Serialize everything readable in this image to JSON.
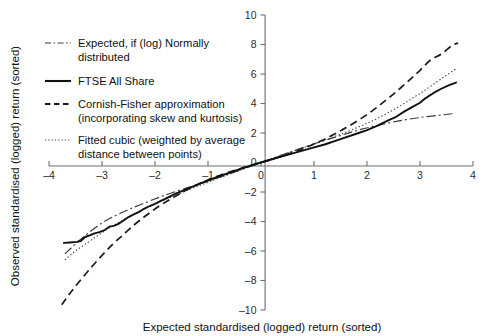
{
  "chart_data": {
    "type": "line",
    "title": "",
    "xlabel": "Expected standardised (logged) return (sorted)",
    "ylabel": "Observed standardised (logged) return (sorted)",
    "xlim": [
      -4,
      4
    ],
    "ylim": [
      -10,
      10
    ],
    "xticks": [
      -4,
      -3,
      -2,
      -1,
      0,
      1,
      2,
      3,
      4
    ],
    "xtick_labels": [
      "–4",
      "–3",
      "–2",
      "–1",
      "0",
      "1",
      "2",
      "3",
      "4"
    ],
    "yticks": [
      -10,
      -8,
      -6,
      -4,
      -2,
      0,
      2,
      4,
      6,
      8,
      10
    ],
    "ytick_labels": [
      "–10",
      "–8",
      "–6",
      "–4",
      "–2",
      "0",
      "2",
      "4",
      "6",
      "8",
      "10"
    ],
    "grid": false,
    "legend_position": "upper-left",
    "axes_style": "spines-bottom-and-center-vertical",
    "series": [
      {
        "name": "Expected, if (log) Normally distributed",
        "style": "dash-dot",
        "color": "#3a3a3a",
        "x": [
          -3.7,
          -3.4,
          -3.0,
          -2.6,
          -2.2,
          -1.8,
          -1.4,
          -1.0,
          -0.6,
          -0.2,
          0.0,
          0.2,
          0.6,
          1.0,
          1.4,
          1.8,
          2.2,
          2.6,
          3.0,
          3.4,
          3.65
        ],
        "y": [
          -6.2,
          -5.2,
          -4.1,
          -3.35,
          -2.75,
          -2.2,
          -1.72,
          -1.26,
          -0.78,
          -0.26,
          0.0,
          0.26,
          0.78,
          1.26,
          1.72,
          2.16,
          2.52,
          2.82,
          3.05,
          3.22,
          3.32
        ]
      },
      {
        "name": "FTSE All Share",
        "style": "solid",
        "color": "#111111",
        "x": [
          -3.72,
          -3.6,
          -3.48,
          -3.4,
          -3.32,
          -3.22,
          -3.14,
          -3.05,
          -2.95,
          -2.86,
          -2.78,
          -2.7,
          -2.6,
          -2.5,
          -2.4,
          -2.3,
          -2.2,
          -2.1,
          -2.0,
          -1.9,
          -1.8,
          -1.6,
          -1.4,
          -1.2,
          -1.0,
          -0.8,
          -0.6,
          -0.4,
          -0.2,
          -0.05,
          0.0,
          0.1,
          0.3,
          0.6,
          0.9,
          1.2,
          1.5,
          1.8,
          2.0,
          2.2,
          2.4,
          2.55,
          2.7,
          2.85,
          3.0,
          3.1,
          3.25,
          3.4,
          3.55,
          3.68
        ],
        "y": [
          -5.45,
          -5.42,
          -5.38,
          -5.32,
          -5.05,
          -4.92,
          -4.8,
          -4.72,
          -4.58,
          -4.35,
          -4.3,
          -4.18,
          -3.95,
          -3.7,
          -3.52,
          -3.35,
          -3.12,
          -2.95,
          -2.8,
          -2.62,
          -2.45,
          -2.1,
          -1.8,
          -1.5,
          -1.22,
          -0.95,
          -0.7,
          -0.45,
          -0.22,
          -0.05,
          0.0,
          0.1,
          0.32,
          0.62,
          0.92,
          1.22,
          1.58,
          1.95,
          2.2,
          2.5,
          2.85,
          3.1,
          3.45,
          3.75,
          4.05,
          4.35,
          4.7,
          5.0,
          5.25,
          5.42
        ]
      },
      {
        "name": "Cornish-Fisher approximation (incorporating skew and kurtosis)",
        "style": "dashed",
        "color": "#1c1c1c",
        "x": [
          -3.76,
          -3.6,
          -3.4,
          -3.2,
          -3.0,
          -2.8,
          -2.6,
          -2.4,
          -2.2,
          -2.0,
          -1.8,
          -1.6,
          -1.4,
          -1.2,
          -1.0,
          -0.8,
          -0.6,
          -0.4,
          -0.2,
          0.0,
          0.2,
          0.4,
          0.6,
          0.8,
          1.0,
          1.2,
          1.4,
          1.6,
          1.8,
          2.0,
          2.2,
          2.4,
          2.6,
          2.8,
          3.0,
          3.2,
          3.4,
          3.6,
          3.72
        ],
        "y": [
          -9.65,
          -8.85,
          -7.95,
          -7.1,
          -6.3,
          -5.55,
          -4.9,
          -4.25,
          -3.68,
          -3.15,
          -2.68,
          -2.25,
          -1.85,
          -1.5,
          -1.18,
          -0.9,
          -0.65,
          -0.42,
          -0.2,
          0.0,
          0.21,
          0.44,
          0.68,
          0.95,
          1.25,
          1.58,
          1.95,
          2.35,
          2.78,
          3.25,
          3.78,
          4.35,
          4.95,
          5.58,
          6.25,
          6.95,
          7.35,
          7.92,
          8.1
        ]
      },
      {
        "name": "Fitted cubic (weighted by average distance between points)",
        "style": "dotted",
        "color": "#4a4a4a",
        "x": [
          -3.7,
          -3.5,
          -3.3,
          -3.1,
          -2.9,
          -2.7,
          -2.5,
          -2.3,
          -2.1,
          -1.9,
          -1.7,
          -1.5,
          -1.3,
          -1.1,
          -0.9,
          -0.7,
          -0.5,
          -0.3,
          -0.1,
          0.0,
          0.2,
          0.4,
          0.7,
          1.0,
          1.3,
          1.6,
          1.9,
          2.1,
          2.3,
          2.5,
          2.7,
          2.9,
          3.1,
          3.3,
          3.5,
          3.68
        ],
        "y": [
          -6.6,
          -6.0,
          -5.5,
          -5.0,
          -4.52,
          -4.1,
          -3.7,
          -3.32,
          -2.98,
          -2.65,
          -2.35,
          -2.05,
          -1.75,
          -1.48,
          -1.2,
          -0.93,
          -0.66,
          -0.4,
          -0.13,
          0.0,
          0.25,
          0.5,
          0.88,
          1.25,
          1.65,
          2.05,
          2.5,
          2.82,
          3.18,
          3.58,
          4.0,
          4.45,
          4.92,
          5.42,
          5.92,
          6.35
        ]
      }
    ]
  },
  "legend": {
    "items": [
      {
        "label_line1": "Expected, if (log) Normally",
        "label_line2": "distributed",
        "style": "dash-dot"
      },
      {
        "label_line1": "FTSE All Share",
        "label_line2": "",
        "style": "solid"
      },
      {
        "label_line1": "Cornish-Fisher approximation",
        "label_line2": "(incorporating skew and kurtosis)",
        "style": "dashed"
      },
      {
        "label_line1": "Fitted cubic (weighted by average",
        "label_line2": "distance between points)",
        "style": "dotted"
      }
    ]
  },
  "axes": {
    "x_title": "Expected standardised (logged) return (sorted)",
    "y_title": "Observed standardised (logged) return (sorted)"
  }
}
